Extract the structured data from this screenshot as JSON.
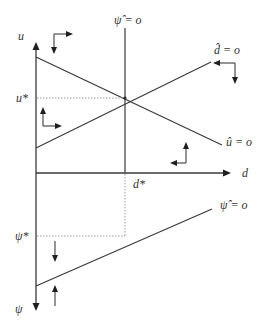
{
  "diagram": {
    "type": "phase diagram",
    "axes": {
      "vertical_top_label": "u",
      "vertical_bottom_label": "ψ",
      "horizontal_label": "d"
    },
    "equilibrium_markers": {
      "u_star": "u*",
      "d_star": "d*",
      "psi_star": "ψ*"
    },
    "loci": [
      {
        "id": "psi_hat_vertical",
        "label": "ψ̂ = o",
        "shape": "vertical line at d*"
      },
      {
        "id": "d_hat",
        "label": "d̂ = o",
        "shape": "upward sloping line"
      },
      {
        "id": "u_hat",
        "label": "û = o",
        "shape": "downward sloping line"
      },
      {
        "id": "psi_hat_lower",
        "label": "ψ̂ = o",
        "shape": "upward sloping line in lower panel"
      }
    ],
    "direction_arrows": [
      {
        "region": "upper-left, above û",
        "directions": [
          "right",
          "down"
        ]
      },
      {
        "region": "upper-right, above d̂",
        "directions": [
          "left",
          "down"
        ]
      },
      {
        "region": "left, below d̂",
        "directions": [
          "up",
          "right"
        ]
      },
      {
        "region": "right, below û",
        "directions": [
          "up",
          "left"
        ]
      },
      {
        "region": "lower panel, above ψ̂ line",
        "directions": [
          "down"
        ]
      },
      {
        "region": "lower panel, below ψ̂ line",
        "directions": [
          "up"
        ]
      }
    ],
    "colors": {
      "line": "#3a3a3a",
      "dotted_guides": "#9a9a9a",
      "background": "#ffffff"
    }
  }
}
